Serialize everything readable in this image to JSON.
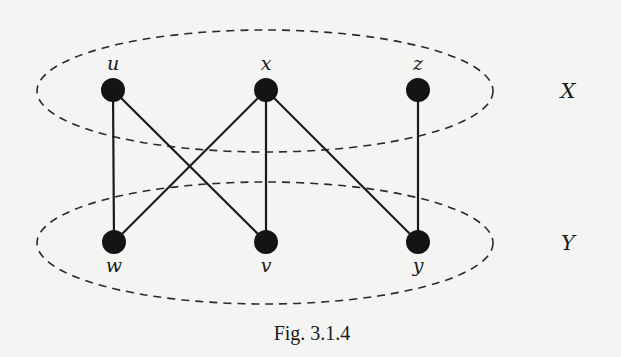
{
  "figure": {
    "caption": "Fig. 3.1.4",
    "type": "bipartite graph"
  },
  "partitions": [
    {
      "id": "X",
      "label": "X",
      "vertices": [
        "u",
        "x",
        "z"
      ]
    },
    {
      "id": "Y",
      "label": "Y",
      "vertices": [
        "w",
        "v",
        "y"
      ]
    }
  ],
  "vertices": [
    {
      "id": "u",
      "label": "u",
      "partition": "X"
    },
    {
      "id": "x",
      "label": "x",
      "partition": "X"
    },
    {
      "id": "z",
      "label": "z",
      "partition": "X"
    },
    {
      "id": "w",
      "label": "w",
      "partition": "Y"
    },
    {
      "id": "v",
      "label": "v",
      "partition": "Y"
    },
    {
      "id": "y",
      "label": "y",
      "partition": "Y"
    }
  ],
  "edges": [
    [
      "u",
      "w"
    ],
    [
      "u",
      "v"
    ],
    [
      "x",
      "w"
    ],
    [
      "x",
      "v"
    ],
    [
      "x",
      "y"
    ],
    [
      "z",
      "y"
    ]
  ],
  "colors": {
    "background": "#f4f4f2",
    "ink": "#141414"
  }
}
